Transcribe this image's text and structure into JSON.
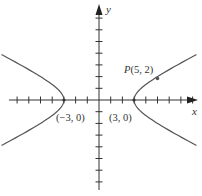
{
  "diagram": {
    "type": "hyperbola",
    "equation": "x^2/9 - y^2/(9/4) = 1",
    "axes": {
      "x_label": "x",
      "y_label": "y",
      "x_ticks": [
        -7,
        -6,
        -5,
        -4,
        -3,
        -2,
        -1,
        1,
        2,
        3,
        4,
        5,
        6,
        7,
        8
      ],
      "y_ticks": [
        -7,
        -6,
        -5,
        -4,
        -3,
        -2,
        -1,
        1,
        2,
        3,
        4,
        5,
        6,
        7
      ]
    },
    "labels": {
      "left_vertex": "(−3, 0)",
      "right_vertex": "(3, 0)",
      "point_name": "P",
      "point_coords": "(5, 2)"
    },
    "points": [
      {
        "name": "left-vertex",
        "x": -3,
        "y": 0
      },
      {
        "name": "right-vertex",
        "x": 3,
        "y": 0
      },
      {
        "name": "P",
        "x": 5,
        "y": 2
      }
    ],
    "colors": {
      "curve": "#555555",
      "axis": "#333333",
      "text": "#333333"
    }
  }
}
